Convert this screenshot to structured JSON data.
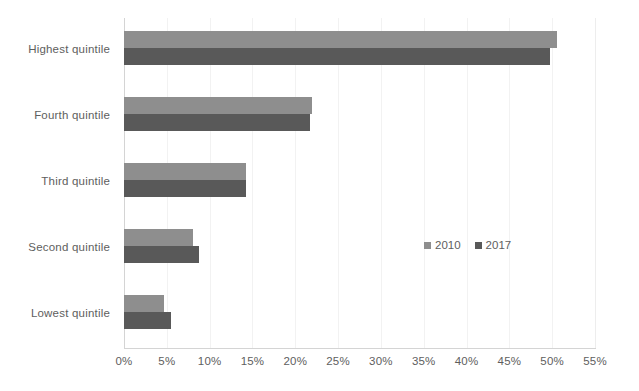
{
  "chart_data": {
    "type": "bar",
    "orientation": "horizontal",
    "title": "",
    "subtitle": "",
    "xlabel": "",
    "ylabel": "",
    "xlim": [
      0,
      55
    ],
    "xunit": "%",
    "xtick_step": 5,
    "grid": true,
    "legend_position": "inside-center-right",
    "categories": [
      "Highest quintile",
      "Fourth quintile",
      "Third quintile",
      "Second quintile",
      "Lowest quintile"
    ],
    "xticks": [
      "0%",
      "5%",
      "10%",
      "15%",
      "20%",
      "25%",
      "30%",
      "35%",
      "40%",
      "45%",
      "50%",
      "55%"
    ],
    "xtick_values": [
      0,
      5,
      10,
      15,
      20,
      25,
      30,
      35,
      40,
      45,
      50,
      55
    ],
    "series": [
      {
        "name": "2010",
        "color": "#8e8e8e",
        "values": [
          50.6,
          22.0,
          14.2,
          8.0,
          4.7
        ]
      },
      {
        "name": "2017",
        "color": "#595959",
        "values": [
          49.8,
          21.7,
          14.2,
          8.8,
          5.5
        ]
      }
    ],
    "legend": [
      {
        "label": "2010",
        "color": "#8e8e8e"
      },
      {
        "label": "2017",
        "color": "#595959"
      }
    ]
  },
  "colors": {
    "background": "#ffffff",
    "gridline": "#f2f2f2",
    "axis": "#d4d4d4",
    "text": "#5e5e5e",
    "series_2010": "#8e8e8e",
    "series_2017": "#595959"
  }
}
